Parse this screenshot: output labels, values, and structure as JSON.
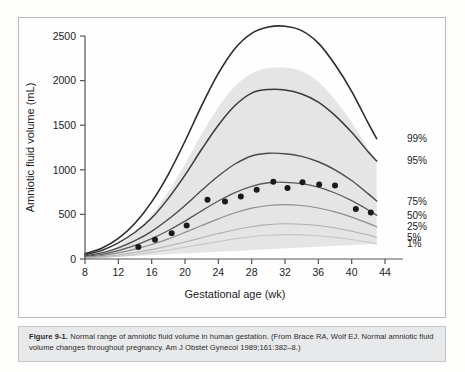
{
  "figure": {
    "caption_label": "Figure 9-1.",
    "caption_body": "Normal range of amniotic fluid volume in human gestation. (From Brace RA, Wolf EJ. Normal amniotic fluid volume changes throughout pregnancy. Am J Obstet Gynecol 1989;161:382–8.)"
  },
  "chart_data": {
    "type": "line",
    "title": "",
    "xlabel": "Gestational age (wk)",
    "ylabel": "Amniotic fluid volume (mL)",
    "xlim": [
      8,
      44
    ],
    "ylim": [
      0,
      2500
    ],
    "xticks": [
      8,
      12,
      16,
      20,
      24,
      28,
      32,
      36,
      40,
      44
    ],
    "yticks": [
      0,
      500,
      1000,
      1500,
      2000,
      2500
    ],
    "grid": false,
    "legend_position": "right-inline",
    "shaded_band": {
      "label": "normal range shading",
      "color": "#e4e4e4",
      "upper_series": "99%",
      "lower_series": "1%"
    },
    "x": [
      8,
      10,
      12,
      14,
      16,
      18,
      20,
      22,
      24,
      26,
      28,
      30,
      32,
      34,
      36,
      38,
      40,
      42,
      43
    ],
    "series": [
      {
        "name": "99%",
        "label": "99%",
        "color": "#2b2b2b",
        "width": 1.6,
        "values": [
          60,
          120,
          230,
          400,
          640,
          950,
          1320,
          1720,
          2080,
          2360,
          2530,
          2600,
          2610,
          2560,
          2420,
          2180,
          1880,
          1520,
          1350
        ]
      },
      {
        "name": "95%",
        "label": "95%",
        "color": "#3a3a3a",
        "width": 1.5,
        "values": [
          48,
          95,
          180,
          300,
          460,
          680,
          940,
          1230,
          1500,
          1720,
          1860,
          1900,
          1895,
          1850,
          1760,
          1610,
          1420,
          1200,
          1100
        ]
      },
      {
        "name": "75%",
        "label": "75%",
        "color": "#4a4a4a",
        "width": 1.4,
        "values": [
          35,
          68,
          125,
          205,
          310,
          445,
          600,
          770,
          930,
          1065,
          1155,
          1185,
          1180,
          1150,
          1090,
          1000,
          880,
          730,
          650
        ]
      },
      {
        "name": "50%",
        "label": "50%",
        "color": "#5a5a5a",
        "width": 1.3,
        "values": [
          28,
          52,
          95,
          152,
          228,
          320,
          425,
          540,
          650,
          745,
          815,
          855,
          860,
          845,
          805,
          740,
          655,
          550,
          490
        ]
      },
      {
        "name": "25%",
        "label": "25%",
        "color": "#8e8e8e",
        "width": 1.2,
        "values": [
          20,
          38,
          68,
          110,
          162,
          225,
          298,
          375,
          450,
          518,
          570,
          600,
          610,
          600,
          572,
          528,
          470,
          400,
          360
        ]
      },
      {
        "name": "5%",
        "label": "5%",
        "color": "#b0b0b0",
        "width": 1.1,
        "values": [
          13,
          25,
          45,
          72,
          105,
          145,
          190,
          238,
          285,
          328,
          362,
          385,
          395,
          390,
          375,
          348,
          312,
          268,
          242
        ]
      },
      {
        "name": "1%",
        "label": "1%",
        "color": "#c6c6c6",
        "width": 1.1,
        "values": [
          9,
          17,
          31,
          49,
          72,
          100,
          131,
          164,
          196,
          226,
          250,
          266,
          273,
          270,
          260,
          242,
          218,
          188,
          170
        ]
      }
    ],
    "scatter": {
      "name": "observed median",
      "label": "",
      "color": "#1a1a1a",
      "marker": "circle",
      "radius": 3,
      "points": [
        {
          "x": 14.4,
          "y": 135
        },
        {
          "x": 16.4,
          "y": 215
        },
        {
          "x": 18.4,
          "y": 290
        },
        {
          "x": 20.2,
          "y": 375
        },
        {
          "x": 22.7,
          "y": 665
        },
        {
          "x": 24.8,
          "y": 645
        },
        {
          "x": 26.7,
          "y": 700
        },
        {
          "x": 28.6,
          "y": 775
        },
        {
          "x": 30.6,
          "y": 865
        },
        {
          "x": 32.3,
          "y": 795
        },
        {
          "x": 34.1,
          "y": 860
        },
        {
          "x": 36.1,
          "y": 835
        },
        {
          "x": 38.0,
          "y": 825
        },
        {
          "x": 40.5,
          "y": 560
        },
        {
          "x": 42.3,
          "y": 520
        }
      ]
    }
  }
}
